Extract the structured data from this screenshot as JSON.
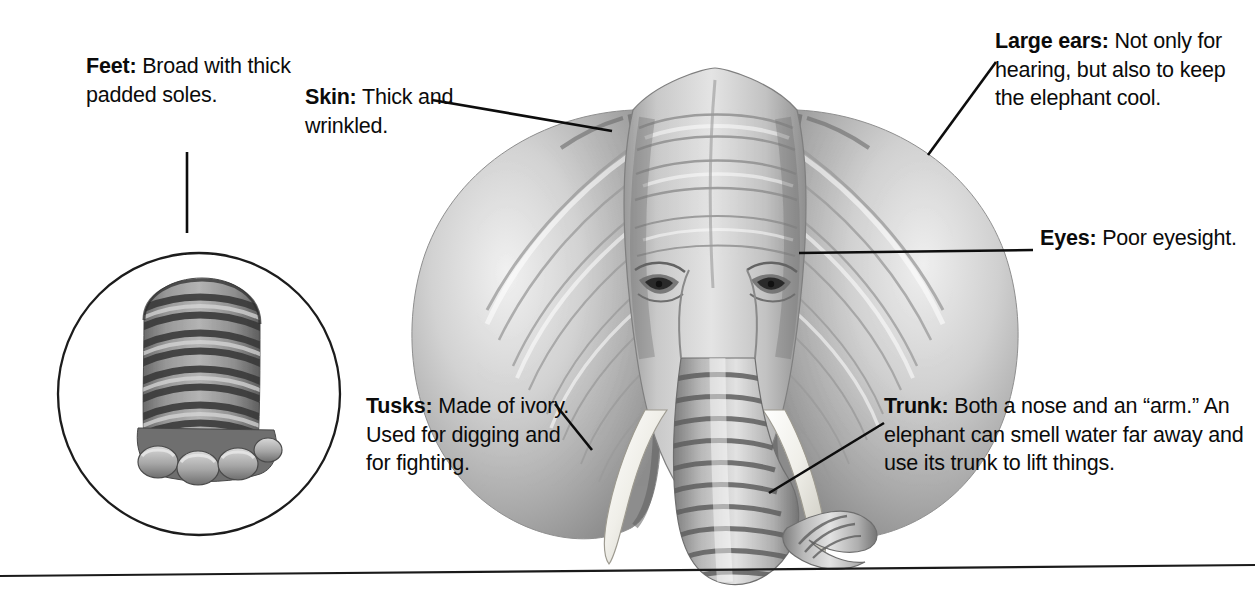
{
  "figure": {
    "caption_style": "labelled-diagram",
    "ink_color": "#0d0d0d",
    "background_color": "#ffffff"
  },
  "callouts": [
    {
      "id": "feet",
      "term": "Feet:",
      "body": " Broad with thick padded soles.",
      "anchor": "foot-inset-circle"
    },
    {
      "id": "skin",
      "term": "Skin:",
      "body": " Thick and wrinkled.",
      "anchor": "forehead"
    },
    {
      "id": "large-ears",
      "term": "Large ears:",
      "body": " Not only for hearing, but also to keep the elephant cool.",
      "anchor": "right-ear"
    },
    {
      "id": "eyes",
      "term": "Eyes:",
      "body": " Poor eyesight.",
      "anchor": "right-eye"
    },
    {
      "id": "tusks",
      "term": "Tusks:",
      "body": " Made of ivory. Used for digging and for fighting.",
      "anchor": "left-tusk"
    },
    {
      "id": "trunk",
      "term": "Trunk:",
      "body": " Both a nose and an “arm.” An elephant can smell water far away and use its trunk to lift things.",
      "anchor": "trunk-curl"
    }
  ],
  "illustrations": [
    {
      "id": "elephant-head",
      "label": "elephant-head-illustration",
      "medium": "pencil-drawing"
    },
    {
      "id": "foot-inset",
      "label": "elephant-foot-illustration",
      "medium": "pencil-drawing",
      "framed": "circle"
    }
  ],
  "rules": [
    {
      "id": "bottom-rule",
      "orientation": "horizontal"
    }
  ]
}
